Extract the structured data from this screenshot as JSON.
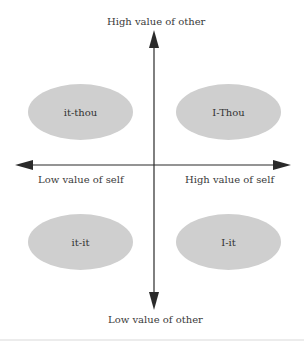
{
  "diagram": {
    "axes": {
      "top_label": "High value of other",
      "bottom_label": "Low value of other",
      "left_label": "Low value of self",
      "right_label": "High value of self"
    },
    "quadrants": [
      {
        "position": "top-left",
        "label": "it-thou"
      },
      {
        "position": "top-right",
        "label": "I-Thou"
      },
      {
        "position": "bottom-left",
        "label": "it-it"
      },
      {
        "position": "bottom-right",
        "label": "I-it"
      }
    ],
    "colors": {
      "ellipse_fill": "#cfcfcf",
      "axis": "#2a2a2a",
      "text": "#3a3a3a"
    }
  }
}
